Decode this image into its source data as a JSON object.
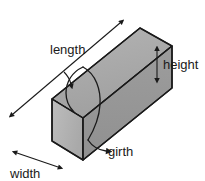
{
  "diagram": {
    "type": "3d-box-dimension-diagram",
    "labels": {
      "length": "length",
      "width": "width",
      "height": "height",
      "girth": "girth"
    },
    "colors": {
      "background": "#ffffff",
      "top_face": "#a9a9a9",
      "front_face": "#969696",
      "end_face": "#b4b4b4",
      "outline": "#1a1a1a",
      "text": "#1a1a1a",
      "arrow": "#1a1a1a",
      "girth_curve": "#1a1a1a"
    },
    "icons": {
      "length_arrow": "double-headed-arrow-diagonal",
      "width_arrow": "double-headed-arrow-diagonal",
      "height_arrow": "double-headed-arrow-vertical",
      "girth_arrow": "curved-arrow-wrap"
    }
  }
}
